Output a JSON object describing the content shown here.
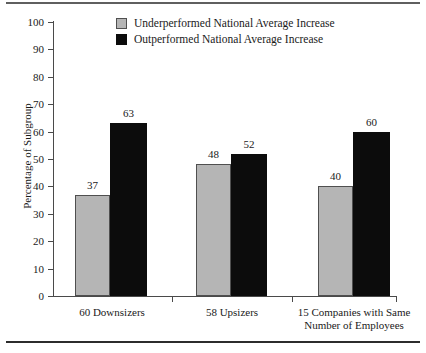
{
  "chart_data": {
    "type": "bar",
    "title": "",
    "xlabel": "",
    "ylabel": "Percentage of Subgroup",
    "ylim": [
      0,
      100
    ],
    "ytick_step": 10,
    "grid": false,
    "legend_position": "top-center",
    "categories": [
      "60 Downsizers",
      "58 Upsizers",
      "15 Companies with Same Number of Employees"
    ],
    "category_lines": [
      [
        "60 Downsizers"
      ],
      [
        "58 Upsizers"
      ],
      [
        "15 Companies with Same",
        "Number of Employees"
      ]
    ],
    "yticks": [
      "0",
      "10",
      "20",
      "30",
      "40",
      "50",
      "60",
      "70",
      "80",
      "90",
      "100"
    ],
    "series": [
      {
        "name": "Underperformed National Average Increase",
        "color": "#b5b5b5",
        "values": [
          37,
          48,
          40
        ]
      },
      {
        "name": "Outperformed National Average Increase",
        "color": "#0c0c0c",
        "values": [
          63,
          52,
          60
        ]
      }
    ]
  },
  "legend": {
    "items": [
      {
        "label": "Underperformed National Average Increase",
        "swatch": "gray"
      },
      {
        "label": "Outperformed National Average Increase",
        "swatch": "black"
      }
    ]
  }
}
